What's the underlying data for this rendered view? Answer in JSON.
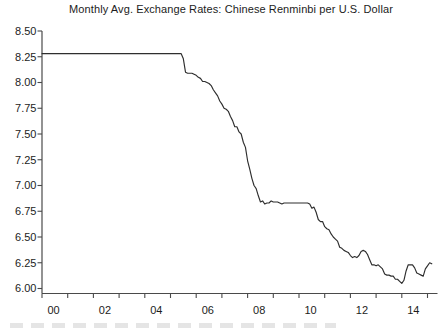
{
  "chart_data": {
    "type": "line",
    "title": "Monthly Avg. Exchange Rates: Chinese Renminbi per U.S. Dollar",
    "xlabel": "",
    "ylabel": "",
    "grid": false,
    "legend_position": "none",
    "ylim": [
      6.0,
      8.5
    ],
    "y_ticks": [
      8.5,
      8.25,
      8.0,
      7.75,
      7.5,
      7.25,
      7.0,
      6.75,
      6.5,
      6.25,
      6.0
    ],
    "y_tick_labels": [
      "8.50",
      "8.25",
      "8.00",
      "7.75",
      "7.50",
      "7.25",
      "7.00",
      "6.75",
      "6.50",
      "6.25",
      "6.00"
    ],
    "x_year_ticks": [
      2000,
      2001,
      2002,
      2003,
      2004,
      2005,
      2006,
      2007,
      2008,
      2009,
      2010,
      2011,
      2012,
      2013,
      2014,
      2015
    ],
    "x_labels": [
      {
        "label": "00",
        "year": 2000
      },
      {
        "label": "02",
        "year": 2002
      },
      {
        "label": "04",
        "year": 2004
      },
      {
        "label": "06",
        "year": 2006
      },
      {
        "label": "08",
        "year": 2008
      },
      {
        "label": "10",
        "year": 2010
      },
      {
        "label": "12",
        "year": 2012
      },
      {
        "label": "14",
        "year": 2014
      }
    ],
    "line_color": "#2e2e2e",
    "axis_color": "#4a4a4a",
    "text_color": "#1c1c1c",
    "background": "#ffffff",
    "series": [
      {
        "name": "Chinese renminbi per U.S. dollar",
        "frequency": "monthly",
        "start": "2000-01",
        "values": [
          8.28,
          8.28,
          8.28,
          8.28,
          8.28,
          8.28,
          8.28,
          8.28,
          8.28,
          8.28,
          8.28,
          8.28,
          8.28,
          8.28,
          8.28,
          8.28,
          8.28,
          8.28,
          8.28,
          8.28,
          8.28,
          8.28,
          8.28,
          8.28,
          8.28,
          8.28,
          8.28,
          8.28,
          8.28,
          8.28,
          8.28,
          8.28,
          8.28,
          8.28,
          8.28,
          8.28,
          8.28,
          8.28,
          8.28,
          8.28,
          8.28,
          8.28,
          8.28,
          8.28,
          8.28,
          8.28,
          8.28,
          8.28,
          8.28,
          8.28,
          8.28,
          8.28,
          8.28,
          8.28,
          8.28,
          8.28,
          8.28,
          8.28,
          8.28,
          8.28,
          8.28,
          8.28,
          8.28,
          8.28,
          8.28,
          8.28,
          8.23,
          8.1,
          8.09,
          8.09,
          8.09,
          8.08,
          8.07,
          8.05,
          8.04,
          8.01,
          8.01,
          8.0,
          7.99,
          7.97,
          7.93,
          7.9,
          7.87,
          7.82,
          7.79,
          7.75,
          7.74,
          7.72,
          7.67,
          7.63,
          7.57,
          7.57,
          7.52,
          7.5,
          7.42,
          7.37,
          7.24,
          7.16,
          7.07,
          7.0,
          6.97,
          6.9,
          6.84,
          6.85,
          6.82,
          6.83,
          6.83,
          6.85,
          6.84,
          6.84,
          6.84,
          6.83,
          6.82,
          6.83,
          6.83,
          6.83,
          6.83,
          6.83,
          6.83,
          6.83,
          6.83,
          6.83,
          6.83,
          6.83,
          6.83,
          6.82,
          6.78,
          6.79,
          6.74,
          6.67,
          6.65,
          6.65,
          6.6,
          6.58,
          6.57,
          6.53,
          6.5,
          6.48,
          6.46,
          6.4,
          6.39,
          6.37,
          6.36,
          6.35,
          6.32,
          6.3,
          6.31,
          6.3,
          6.32,
          6.36,
          6.37,
          6.36,
          6.33,
          6.28,
          6.23,
          6.23,
          6.22,
          6.23,
          6.21,
          6.19,
          6.14,
          6.13,
          6.13,
          6.12,
          6.12,
          6.09,
          6.09,
          6.07,
          6.05,
          6.08,
          6.17,
          6.23,
          6.23,
          6.23,
          6.2,
          6.15,
          6.14,
          6.13,
          6.12,
          6.19,
          6.22,
          6.25,
          6.24
        ]
      }
    ]
  }
}
